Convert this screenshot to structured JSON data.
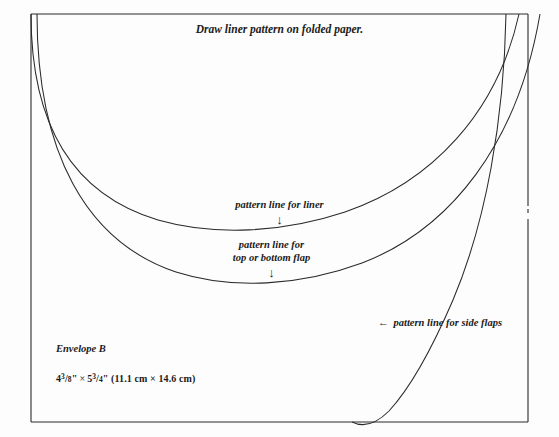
{
  "diagram": {
    "title": "Draw liner pattern on folded paper.",
    "labels": {
      "liner": "pattern line for liner",
      "flap_line1": "pattern line for",
      "flap_line2": "top or bottom flap",
      "side_flaps": "pattern line for side flaps",
      "down_arrow": "↓",
      "left_arrow": "←"
    },
    "envelope": {
      "name": "Envelope B",
      "inches_width_whole": "4",
      "inches_width_num": "3",
      "inches_width_den": "8",
      "inches_height_whole": "5",
      "inches_height_num": "3",
      "inches_height_den": "4",
      "inch_mark": "\"",
      "times": "×",
      "metric": "(11.1 cm × 14.6 cm)"
    },
    "colors": {
      "background": "#fdfdfd",
      "ink": "#1b1b1b",
      "line": "#2a2a2a"
    },
    "frame": {
      "left": 31,
      "top": 14,
      "right": 528,
      "bottom": 422
    },
    "curves": {
      "liner_arc": "M 31,14 C 31,132 78,196 158,220 C 214,236 282,233 345,212 C 432,182 497,113 519,14",
      "flap_arc": "M 37,14 C 37,152 86,242 176,272 C 232,290 300,286 362,263 C 451,229 518,143 540,14",
      "side_flap_arc": "M 506,14 C 504,120 486,222 453,300 C 434,344 413,385 389,411 C 375,425 362,427 352,422"
    }
  }
}
